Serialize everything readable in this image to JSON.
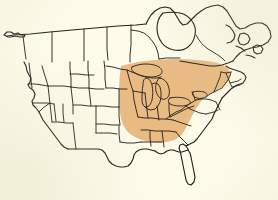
{
  "figure": {
    "kind": "distribution-range-map",
    "background_color": "#fdfbea",
    "outline_color": "#25211c",
    "shading_color": "#e8b77c",
    "shading_opacity": 0.95,
    "width_px": 278,
    "height_px": 200,
    "has_title": false,
    "has_caption": false,
    "has_legend": false,
    "has_labels": false
  },
  "map": {
    "projection_note": "simplified political outline of the United States and Canada",
    "features": [
      {
        "name": "canada-outline",
        "label": "Canada",
        "shaded": false
      },
      {
        "name": "united-states-outline",
        "label": "United States",
        "shaded": "partial"
      },
      {
        "name": "hudson-bay",
        "label": "Hudson Bay",
        "shaded": false
      },
      {
        "name": "great-lakes",
        "label": "Great Lakes",
        "shaded": false
      },
      {
        "name": "florida-peninsula",
        "label": "Florida",
        "shaded": false
      },
      {
        "name": "state-borders",
        "label": "State and province boundaries",
        "shaded": false
      }
    ],
    "range_overlay": {
      "name": "shaded-range-region",
      "color": "#e8b77c",
      "description": "Eastern and midwestern United States",
      "covers": [
        "Minnesota",
        "Iowa",
        "Missouri",
        "Arkansas",
        "Wisconsin",
        "Illinois",
        "Michigan",
        "Indiana",
        "Ohio",
        "Kentucky",
        "Tennessee",
        "West Virginia",
        "Virginia",
        "North Carolina",
        "South Carolina",
        "Georgia",
        "Pennsylvania",
        "New York",
        "New Jersey",
        "Maryland",
        "Delaware",
        "Connecticut",
        "Rhode Island",
        "Massachusetts",
        "Vermont",
        "New Hampshire",
        "Maine",
        "southern Ontario",
        "southern Quebec"
      ],
      "excludes": [
        "Pacific states",
        "Rocky Mountain states",
        "Great Plains",
        "Texas",
        "Florida",
        "Alabama",
        "Mississippi",
        "Louisiana",
        "northern Canada"
      ]
    }
  }
}
